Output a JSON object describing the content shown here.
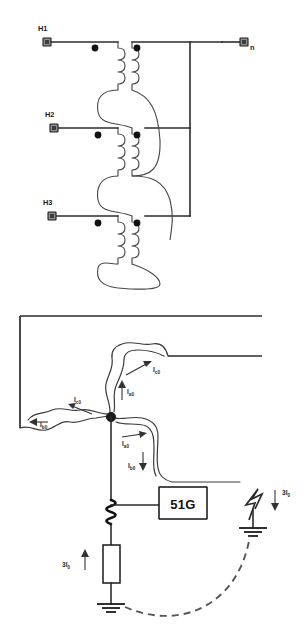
{
  "diagram": {
    "colors": {
      "wire": "#2b2b2b",
      "coil": "#4a4a4a",
      "dot": "#111111",
      "dashed_return": "#555555",
      "relay_border": "#111111",
      "background": "#ffffff"
    }
  },
  "transformer": {
    "terminals": [
      {
        "id": "h1",
        "label": "H1"
      },
      {
        "id": "h2",
        "label": "H2"
      },
      {
        "id": "h3",
        "label": "H3"
      },
      {
        "id": "n",
        "label": "n"
      }
    ],
    "phase_count": 3,
    "windings_per_phase": 2,
    "polarity_dot_count": 6
  },
  "protection": {
    "relay": {
      "designation": "51G",
      "description": "ground time overcurrent relay"
    },
    "currents": [
      {
        "id": "ia0",
        "base": "I",
        "subscript": "a0"
      },
      {
        "id": "ib0",
        "base": "I",
        "subscript": "b0"
      },
      {
        "id": "ic0",
        "base": "I",
        "subscript": "c0"
      },
      {
        "id": "ia0_b",
        "base": "I",
        "subscript": "a0"
      },
      {
        "id": "ib0_b",
        "base": "I",
        "subscript": "b0"
      },
      {
        "id": "ic0_b",
        "base": "I",
        "subscript": "c0"
      }
    ],
    "residual": [
      {
        "id": "residual_fault",
        "base": "3I",
        "subscript": "0",
        "direction": "down"
      },
      {
        "id": "residual_neutral",
        "base": "3I",
        "subscript": "0",
        "direction": "up"
      }
    ],
    "components": [
      {
        "id": "ct",
        "name": "current-transformer-coil"
      },
      {
        "id": "resistor",
        "name": "grounding-resistor"
      },
      {
        "id": "ground-neutral",
        "name": "neutral-ground-symbol"
      },
      {
        "id": "ground-fault",
        "name": "fault-ground-symbol"
      },
      {
        "id": "fault-arrow",
        "name": "ground-fault-indicator"
      },
      {
        "id": "return-path",
        "name": "dashed-ground-return-path"
      }
    ]
  }
}
